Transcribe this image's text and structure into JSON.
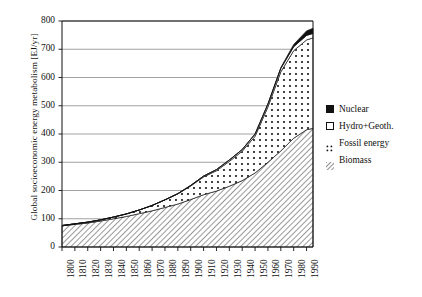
{
  "chart_data": {
    "type": "area",
    "title": "",
    "subtitle": "",
    "xlabel": "",
    "ylabel": "Global socioeconomic energy metabolism [EJ/yr]",
    "xlim": [
      1800,
      1995
    ],
    "ylim": [
      0,
      800
    ],
    "grid": true,
    "legend_position": "right",
    "stacked": true,
    "ytick_labels": [
      "0",
      "100",
      "200",
      "300",
      "400",
      "500",
      "600",
      "700",
      "800"
    ],
    "ytick_values": [
      0,
      100,
      200,
      300,
      400,
      500,
      600,
      700,
      800
    ],
    "xtick_labels": [
      "1800",
      "1810",
      "1820",
      "1830",
      "1840",
      "1850",
      "1860",
      "1870",
      "1880",
      "1890",
      "1900",
      "1910",
      "1920",
      "1930",
      "1940",
      "1950",
      "1960",
      "1970",
      "1980",
      "1990"
    ],
    "xtick_values": [
      1800,
      1810,
      1820,
      1830,
      1840,
      1850,
      1860,
      1870,
      1880,
      1890,
      1900,
      1910,
      1920,
      1930,
      1940,
      1950,
      1960,
      1970,
      1980,
      1990
    ],
    "x": [
      1800,
      1810,
      1820,
      1830,
      1840,
      1850,
      1860,
      1870,
      1880,
      1890,
      1900,
      1910,
      1920,
      1930,
      1940,
      1950,
      1960,
      1970,
      1980,
      1990,
      1995
    ],
    "series": [
      {
        "name": "Biomass",
        "fill": "hatch-diagonal",
        "color": "#ffffff",
        "values": [
          75,
          80,
          85,
          92,
          100,
          108,
          118,
          128,
          140,
          152,
          168,
          185,
          198,
          215,
          235,
          262,
          300,
          340,
          385,
          415,
          420
        ]
      },
      {
        "name": "Fossil energy",
        "fill": "dotted",
        "color": "#ffffff",
        "values": [
          1,
          2,
          3,
          4,
          6,
          9,
          13,
          19,
          27,
          36,
          48,
          63,
          72,
          88,
          104,
          130,
          196,
          280,
          310,
          318,
          320
        ]
      },
      {
        "name": "Hydro+Geoth.",
        "fill": "solid-white",
        "color": "#ffffff",
        "values": [
          0,
          0,
          0,
          0,
          0,
          0,
          0,
          0,
          0,
          1,
          2,
          3,
          4,
          5,
          6,
          8,
          10,
          12,
          14,
          16,
          16
        ]
      },
      {
        "name": "Nuclear",
        "fill": "solid-black",
        "color": "#111111",
        "values": [
          0,
          0,
          0,
          0,
          0,
          0,
          0,
          0,
          0,
          0,
          0,
          0,
          0,
          0,
          0,
          0,
          1,
          3,
          8,
          16,
          18
        ]
      }
    ],
    "totals": [
      76,
      82,
      88,
      96,
      106,
      117,
      131,
      147,
      167,
      189,
      218,
      251,
      274,
      308,
      345,
      400,
      507,
      635,
      717,
      765,
      774
    ],
    "legend": [
      "Nuclear",
      "Hydro+Geoth.",
      "Fossil energy",
      "Biomass"
    ]
  },
  "legend": {
    "items": [
      {
        "label": "Nuclear",
        "swatch": "solid-black-swatch"
      },
      {
        "label": "Hydro+Geoth.",
        "swatch": "open-square-swatch"
      },
      {
        "label": "Fossil energy",
        "swatch": "dotted-swatch"
      },
      {
        "label": "Biomass",
        "swatch": "hatched-swatch"
      }
    ]
  }
}
